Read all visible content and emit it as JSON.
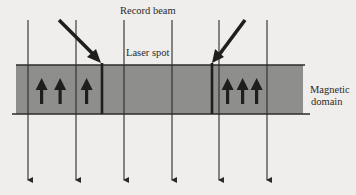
{
  "labels": {
    "record_beam": "Record beam",
    "laser_spot": "Laser spot",
    "magnetic_domain_line1": "Magnetic",
    "magnetic_domain_line2": "domain"
  },
  "diagram": {
    "band_color": "#8e8e8c",
    "line_color": "#2b2b2b",
    "background": "#efeeec",
    "vertical_lines_x": [
      28,
      76,
      124,
      172,
      219,
      267
    ],
    "band": {
      "left": 16,
      "top": 65,
      "right": 303,
      "bottom": 114
    },
    "left_domain_arrows": 3,
    "right_domain_arrows": 3,
    "domain_walls_x": [
      102,
      212
    ],
    "beam_arrows": [
      {
        "from": [
          58,
          20
        ],
        "to": [
          101,
          62
        ]
      },
      {
        "from": [
          245,
          20
        ],
        "to": [
          213,
          62
        ]
      }
    ]
  }
}
